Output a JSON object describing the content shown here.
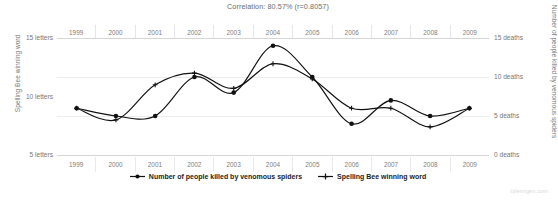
{
  "title": "Correlation: 80.57% (r=0.8057)",
  "watermark": "tylervigen.com",
  "footnote": "",
  "axes": {
    "left_title": "Spelling Bee winning word",
    "right_title": "Number of people killed by venomous spiders",
    "left_ticks": [
      "15 letters",
      "10 letters",
      "5 letters"
    ],
    "right_ticks": [
      "15 deaths",
      "10 deaths",
      "5 deaths",
      "0 deaths"
    ]
  },
  "legend": [
    {
      "label": "Number of people killed by venomous spiders",
      "marker": "round-dot-line",
      "color": "#111111"
    },
    {
      "label": "Spelling Bee winning word",
      "marker": "plus-dot-line",
      "color": "#111111"
    }
  ],
  "chart_data": {
    "type": "line",
    "title": "Correlation: 80.57% (r=0.8057)",
    "xlabel": "",
    "grid": true,
    "legend_position": "bottom",
    "x": [
      1999,
      2000,
      2001,
      2002,
      2003,
      2004,
      2005,
      2006,
      2007,
      2008,
      2009
    ],
    "categories": [
      "1999",
      "2000",
      "2001",
      "2002",
      "2003",
      "2004",
      "2005",
      "2006",
      "2007",
      "2008",
      "2009"
    ],
    "series": [
      {
        "name": "Number of people killed by venomous spiders",
        "marker": "round-dot",
        "axis": "right",
        "unit": "deaths",
        "ylabel": "Number of people killed by venomous spiders",
        "ylim": [
          0,
          15
        ],
        "yticks": [
          0,
          5,
          10,
          15
        ],
        "values": [
          6,
          5,
          5,
          10,
          8,
          14,
          10,
          4,
          7,
          5,
          6
        ]
      },
      {
        "name": "Spelling Bee winning word",
        "marker": "plus-dot",
        "axis": "left",
        "unit": "letters",
        "ylabel": "Spelling Bee winning word",
        "ylim": [
          5,
          15
        ],
        "yticks": [
          5,
          10,
          15
        ],
        "values": [
          9,
          8,
          11,
          12,
          10.7,
          12.8,
          11.5,
          9,
          9,
          7.4,
          9
        ]
      }
    ]
  }
}
